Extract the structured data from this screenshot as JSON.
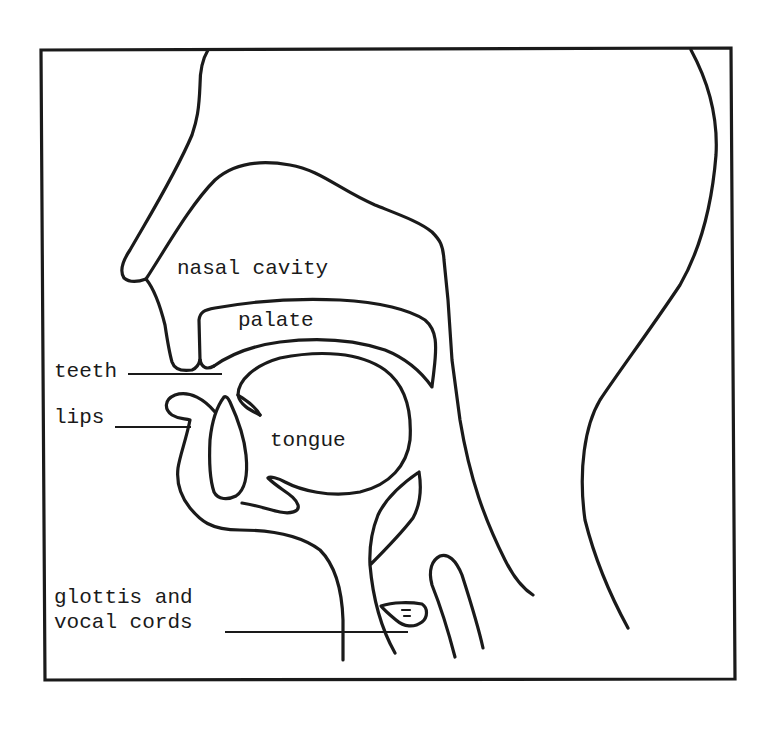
{
  "diagram": {
    "labels": {
      "nasal_cavity": "nasal cavity",
      "palate": "palate",
      "teeth": "teeth",
      "lips": "lips",
      "tongue": "tongue",
      "glottis_line1": "glottis and",
      "glottis_line2": "vocal cords"
    },
    "colors": {
      "ink": "#1a1a1a",
      "background": "#ffffff"
    }
  }
}
